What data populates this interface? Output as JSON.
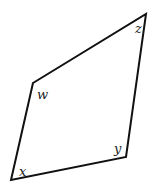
{
  "diagram": {
    "type": "quadrilateral",
    "stroke_color": "#111111",
    "background": "#ffffff",
    "vertices": [
      {
        "id": "w",
        "label": "w",
        "x": 33,
        "y": 83,
        "label_x": 37,
        "label_y": 99
      },
      {
        "id": "z",
        "label": "z",
        "x": 146,
        "y": 14,
        "label_x": 135,
        "label_y": 33
      },
      {
        "id": "y",
        "label": "y",
        "x": 126,
        "y": 157,
        "label_x": 114,
        "label_y": 153
      },
      {
        "id": "x",
        "label": "x",
        "x": 11,
        "y": 180,
        "label_x": 19,
        "label_y": 176
      }
    ]
  }
}
